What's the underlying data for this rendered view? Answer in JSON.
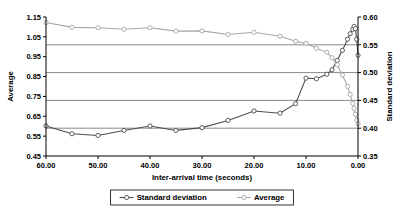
{
  "chart_data": {
    "type": "line",
    "title": "",
    "xlabel": "Inter-arrival time (seconds)",
    "ylabel": "Average",
    "y2label": "Standard deviation",
    "xlim": [
      60,
      0
    ],
    "x_reversed": true,
    "ylim": [
      0.45,
      1.15
    ],
    "y2lim": [
      0.35,
      0.6
    ],
    "grid": true,
    "gridlines_axis": "secondary",
    "legend_position": "bottom",
    "xticks": [
      "60.00",
      "50.00",
      "40.00",
      "30.00",
      "20.00",
      "10.00",
      "0.00"
    ],
    "xtick_values": [
      60,
      50,
      40,
      30,
      20,
      10,
      0
    ],
    "yticks": [
      "0.45",
      "0.55",
      "0.65",
      "0.75",
      "0.85",
      "0.95",
      "1.05",
      "1.15"
    ],
    "ytick_values": [
      0.45,
      0.55,
      0.65,
      0.75,
      0.85,
      0.95,
      1.05,
      1.15
    ],
    "y2ticks": [
      "0.35",
      "0.40",
      "0.45",
      "0.50",
      "0.55",
      "0.60"
    ],
    "y2tick_values": [
      0.35,
      0.4,
      0.45,
      0.5,
      0.55,
      0.6
    ],
    "series": [
      {
        "name": "Standard deviation",
        "axis": "secondary",
        "color": "#4d4d4d",
        "marker": "circle-open",
        "x": [
          60,
          55,
          50,
          45,
          40,
          35,
          30,
          25,
          20,
          15,
          12,
          10,
          8,
          6,
          5,
          4,
          3,
          2,
          1.5,
          1,
          0.75,
          0.5,
          0.25,
          0
        ],
        "values": [
          0.404,
          0.39,
          0.387,
          0.396,
          0.404,
          0.396,
          0.401,
          0.414,
          0.431,
          0.427,
          0.444,
          0.49,
          0.489,
          0.497,
          0.505,
          0.522,
          0.54,
          0.56,
          0.57,
          0.578,
          0.583,
          0.579,
          0.56,
          0.531
        ]
      },
      {
        "name": "Average",
        "axis": "primary",
        "color": "#a6a6a6",
        "marker": "circle-open",
        "x": [
          60,
          55,
          50,
          45,
          40,
          35,
          30,
          25,
          20,
          15,
          12,
          10,
          8,
          6,
          5,
          4,
          3,
          2,
          1.5,
          1,
          0.75,
          0.5,
          0.25,
          0
        ],
        "values": [
          1.122,
          1.098,
          1.096,
          1.088,
          1.096,
          1.079,
          1.08,
          1.062,
          1.073,
          1.053,
          1.028,
          1.017,
          0.993,
          0.972,
          0.945,
          0.909,
          0.858,
          0.8,
          0.76,
          0.715,
          0.69,
          0.66,
          0.63,
          0.612
        ]
      }
    ]
  },
  "legend": {
    "items": [
      {
        "label": "Standard deviation"
      },
      {
        "label": "Average"
      }
    ]
  }
}
